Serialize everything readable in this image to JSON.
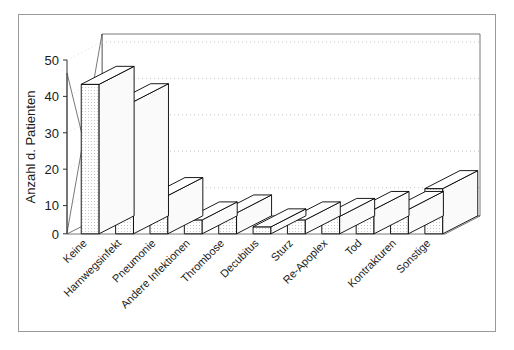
{
  "chart_data": {
    "type": "bar",
    "title": "",
    "xlabel": "",
    "ylabel": "Anzahl d. Patienten",
    "ylim": [
      0,
      50
    ],
    "yticks": [
      0,
      10,
      20,
      30,
      40,
      50
    ],
    "ytick_labels": [
      "0",
      "10",
      "20",
      "30",
      "40",
      "50"
    ],
    "grid": true,
    "legend": "none",
    "three_d": true,
    "categories": [
      "Keine",
      "Harnwegsinfekt",
      "Pneumonie",
      "Andere Infektionen",
      "Thrombose",
      "Decubitus",
      "Sturz",
      "Re-Apoplex",
      "Tod",
      "Kontrakturen",
      "Sonstige"
    ],
    "values": [
      43,
      38,
      11,
      4,
      6,
      2,
      4,
      5,
      7,
      7,
      13
    ]
  },
  "figure": {
    "caption": "",
    "border_color": "#9a9a9a",
    "bar_face_color": "#f2f2f2",
    "bar_top_color": "#ffffff",
    "bar_side_color": "#fafafa",
    "bar_edge_color": "#000000",
    "grid_color": "#bbbbbb",
    "wall_color": "#ffffff",
    "floor_color": "#ffffff"
  }
}
